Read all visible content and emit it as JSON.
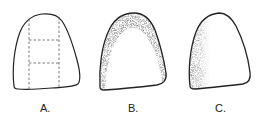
{
  "figure": {
    "panels": [
      {
        "id": "A",
        "label": "A.",
        "style": "outline with dashed 3x3-section grid (vertical lines dividing into thirds, horizontal lines in central section)"
      },
      {
        "id": "B",
        "label": "B.",
        "style": "outline with stippled shading along the top and both sides (inverted-U band)"
      },
      {
        "id": "C",
        "label": "C.",
        "style": "outline with stippled shading along the left side only"
      }
    ],
    "colors": {
      "stroke": "#222222",
      "stipple": "#444444",
      "background": "#ffffff"
    }
  }
}
